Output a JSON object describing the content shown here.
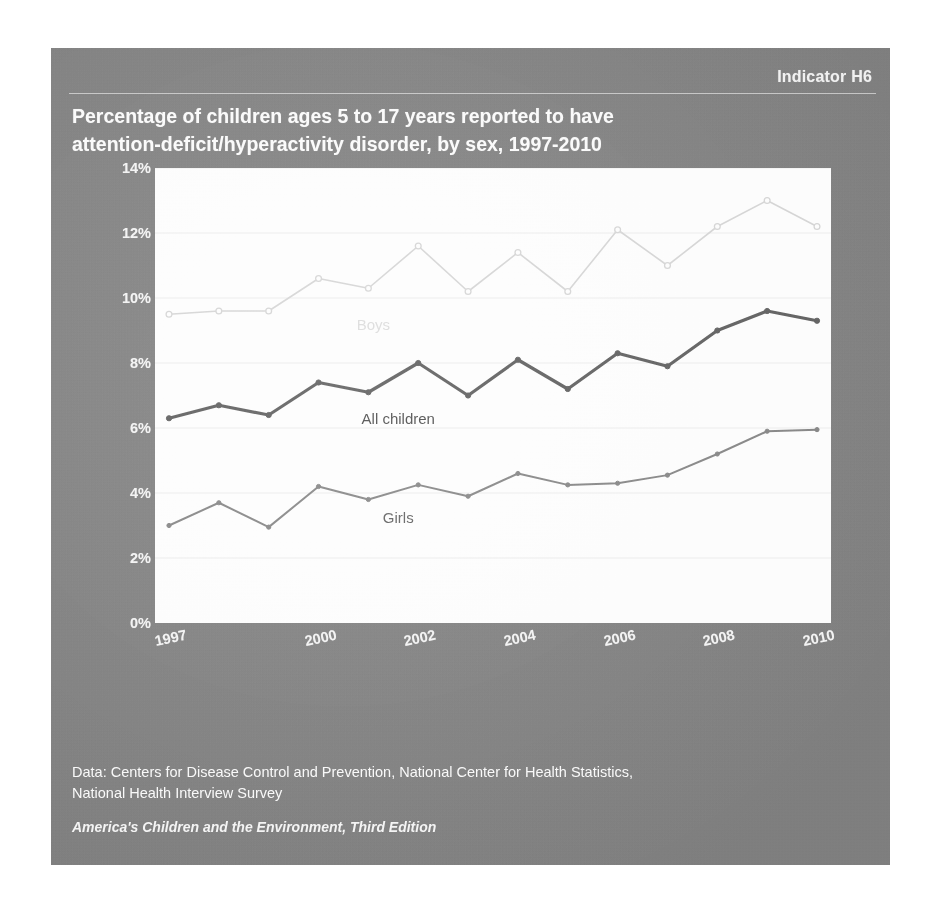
{
  "indicator": "Indicator H6",
  "title": {
    "line1": "Percentage of children ages 5 to 17 years reported to have",
    "line2": "attention-deficit/hyperactivity disorder, by sex, 1997-2010"
  },
  "footer": {
    "source_line1": "Data: Centers for Disease Control and Prevention, National Center for Health Statistics,",
    "source_line2": "National Health Interview Survey",
    "publication": "America's Children and the Environment, Third Edition"
  },
  "colors": {
    "panel_background": "#8a8a8a",
    "plot_background": "#fdfdfd",
    "boys_line": "#d8d8d8",
    "all_children_line": "#6b6b6b",
    "girls_line": "#8f8f8f",
    "gridline": "#ededed",
    "title_text": "#fbfbfb"
  },
  "chart_data": {
    "type": "line",
    "title": "Percentage of children ages 5 to 17 years reported to have attention-deficit/hyperactivity disorder, by sex, 1997-2010",
    "xlabel": "",
    "ylabel": "",
    "ylim": [
      0,
      14
    ],
    "ytick_labels": [
      "0%",
      "2%",
      "4%",
      "6%",
      "8%",
      "10%",
      "12%",
      "14%"
    ],
    "ytick_values": [
      0,
      2,
      4,
      6,
      8,
      10,
      12,
      14
    ],
    "xtick_labels": [
      "1997",
      "2000",
      "2002",
      "2004",
      "2006",
      "2008",
      "2010"
    ],
    "xtick_values": [
      1997,
      2000,
      2002,
      2004,
      2006,
      2008,
      2010
    ],
    "x": [
      1997,
      1998,
      1999,
      2000,
      2001,
      2002,
      2003,
      2004,
      2005,
      2006,
      2007,
      2008,
      2009,
      2010
    ],
    "grid": "horizontal",
    "legend_position": "inline-labels",
    "series": [
      {
        "name": "Boys",
        "color": "#d8d8d8",
        "markers": true,
        "values": [
          9.5,
          9.6,
          9.6,
          10.6,
          10.3,
          11.6,
          10.2,
          11.4,
          10.2,
          12.1,
          11.0,
          12.2,
          13.0,
          12.2
        ],
        "label_position": {
          "year": 2001.1,
          "value": 9.2
        }
      },
      {
        "name": "All children",
        "color": "#6b6b6b",
        "markers": true,
        "values": [
          6.3,
          6.7,
          6.4,
          7.4,
          7.1,
          8.0,
          7.0,
          8.1,
          7.2,
          8.3,
          7.9,
          9.0,
          9.6,
          9.3
        ],
        "label_position": {
          "year": 2001.6,
          "value": 6.3
        }
      },
      {
        "name": "Girls",
        "color": "#8f8f8f",
        "markers": true,
        "values": [
          3.0,
          3.7,
          2.95,
          4.2,
          3.8,
          4.25,
          3.9,
          4.6,
          4.25,
          4.3,
          4.55,
          5.2,
          5.9,
          5.95
        ],
        "label_position": {
          "year": 2001.6,
          "value": 3.25
        }
      }
    ]
  }
}
